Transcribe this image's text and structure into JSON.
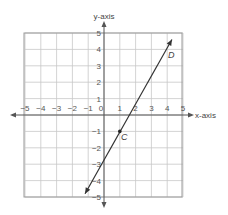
{
  "chart_data": {
    "type": "line",
    "title": "",
    "xlabel": "x-axis",
    "ylabel": "y-axis",
    "xlim": [
      -5,
      5
    ],
    "ylim": [
      -5,
      5
    ],
    "grid": true,
    "x_ticks": [
      "-5",
      "-4",
      "-3",
      "-2",
      "-1",
      "0",
      "1",
      "2",
      "3",
      "4",
      "5"
    ],
    "y_ticks": [
      "5",
      "4",
      "3",
      "2",
      "1",
      "-1",
      "-2",
      "-3",
      "-4",
      "-5"
    ],
    "series": [
      {
        "name": "line CD",
        "equation": "y = 2x - 3",
        "x": [
          -1.0,
          4.0
        ],
        "y": [
          -5.0,
          5.0
        ],
        "arrows_both_ends": true
      }
    ],
    "points": [
      {
        "label": "C",
        "x": 1,
        "y": -1
      },
      {
        "label": "D",
        "x": 4,
        "y": 5
      }
    ]
  },
  "labels": {
    "x_axis": "x-axis",
    "y_axis": "y-axis",
    "point_c": "C",
    "point_d": "D"
  }
}
